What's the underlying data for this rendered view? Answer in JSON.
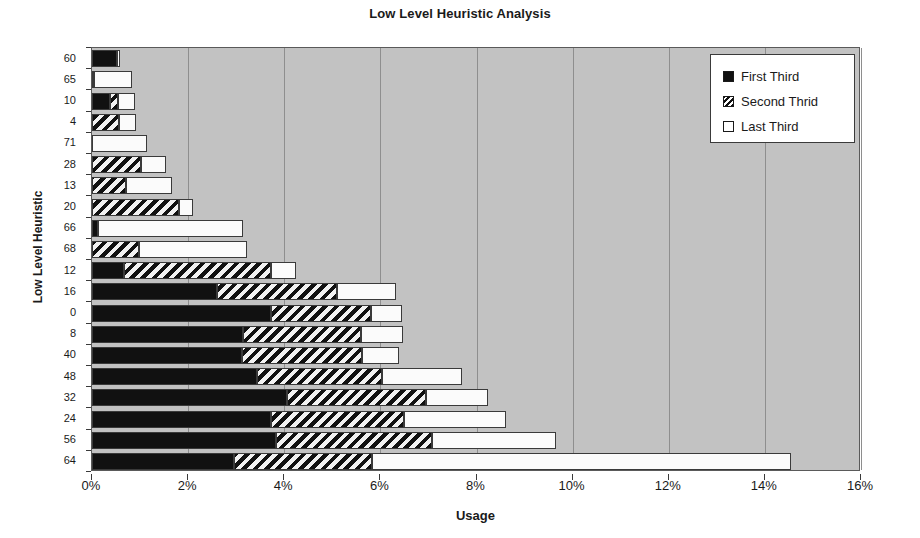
{
  "chart_data": {
    "type": "bar",
    "orientation": "horizontal",
    "stacked": true,
    "title": "Low Level Heuristic Analysis",
    "xlabel": "Usage",
    "ylabel": "Low Level Heuristic",
    "xlim": [
      0,
      16
    ],
    "xtick_labels": [
      "0%",
      "2%",
      "4%",
      "6%",
      "8%",
      "10%",
      "12%",
      "14%",
      "16%"
    ],
    "xticks": [
      0,
      2,
      4,
      6,
      8,
      10,
      12,
      14,
      16
    ],
    "grid": "vertical",
    "legend_position": "top-right",
    "plot_background": "#c2c2c2",
    "categories": [
      "60",
      "65",
      "10",
      "4",
      "71",
      "28",
      "13",
      "20",
      "66",
      "68",
      "12",
      "16",
      "0",
      "8",
      "40",
      "48",
      "32",
      "24",
      "56",
      "64"
    ],
    "series": [
      {
        "name": "First Third",
        "fill": "solid-black",
        "color": "#111111",
        "values": [
          0.52,
          0.05,
          0.38,
          0.0,
          0.0,
          0.0,
          0.0,
          0.0,
          0.12,
          0.0,
          0.67,
          2.6,
          3.72,
          3.15,
          3.12,
          3.43,
          4.06,
          3.72,
          3.83,
          2.96
        ]
      },
      {
        "name": "Second Thrid",
        "fill": "diagonal-hatch",
        "color": "#111111",
        "values": [
          0.0,
          0.0,
          0.17,
          0.56,
          0.0,
          1.02,
          0.71,
          1.81,
          0.0,
          0.98,
          3.06,
          2.5,
          2.08,
          2.45,
          2.5,
          2.6,
          2.89,
          2.77,
          3.25,
          2.87
        ]
      },
      {
        "name": "Last Third",
        "fill": "white",
        "color": "#fbfbfb",
        "values": [
          0.06,
          0.78,
          0.34,
          0.35,
          1.14,
          0.52,
          0.96,
          0.29,
          3.02,
          2.24,
          0.52,
          1.22,
          0.64,
          0.87,
          0.77,
          1.67,
          1.29,
          2.13,
          2.58,
          8.71
        ]
      }
    ],
    "totals": [
      0.58,
      0.83,
      0.89,
      0.91,
      1.14,
      1.54,
      1.67,
      2.1,
      3.14,
      3.22,
      4.25,
      6.32,
      6.44,
      6.47,
      6.39,
      7.7,
      8.24,
      8.62,
      9.66,
      14.54
    ]
  },
  "legend": {
    "items": [
      {
        "label": "First Third",
        "swatch": "solid-black-swatch"
      },
      {
        "label": "Second Thrid",
        "swatch": "hatched-swatch"
      },
      {
        "label": "Last Third",
        "swatch": "white-swatch"
      }
    ]
  }
}
